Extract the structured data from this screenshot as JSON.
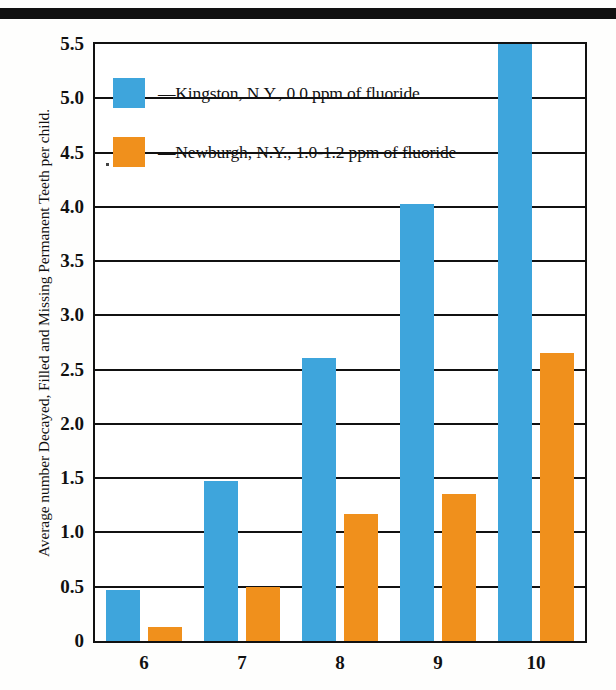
{
  "chart_data": {
    "type": "bar",
    "title": "",
    "subtitle": "",
    "xlabel": "",
    "ylabel": "Average number Decayed, Filled and Missing Permanent Teeth per child.",
    "categories": [
      "6",
      "7",
      "8",
      "9",
      "10"
    ],
    "series": [
      {
        "name": "—Kingston, N.Y., 0.0 ppm of fluoride",
        "short_name": "Kingston, N.Y.",
        "color": "#3EA5DC",
        "values": [
          0.47,
          1.47,
          2.61,
          4.03,
          5.5
        ]
      },
      {
        "name": "—Newburgh, N.Y., 1.0-1.2 ppm of fluoride",
        "short_name": "Newburgh, N.Y.",
        "color": "#F0901C",
        "values": [
          0.13,
          0.5,
          1.17,
          1.35,
          2.65
        ]
      }
    ],
    "ylim": [
      0,
      5.5
    ],
    "yticks": [
      "0",
      "0.5",
      "1.0",
      "1.5",
      "2.0",
      "2.5",
      "3.0",
      "3.5",
      "4.0",
      "4.5",
      "5.0",
      "5.5"
    ],
    "ytick_values": [
      0,
      0.5,
      1.0,
      1.5,
      2.0,
      2.5,
      3.0,
      3.5,
      4.0,
      4.5,
      5.0,
      5.5
    ],
    "grid": true,
    "grid_axis": "y",
    "legend_position": "top-left"
  },
  "legend": {
    "entries": [
      {
        "label": "—Kingston, N.Y., 0.0 ppm of fluoride",
        "color": "#3EA5DC"
      },
      {
        "label": "—Newburgh, N.Y., 1.0-1.2 ppm of fluoride",
        "color": "#F0901C"
      }
    ]
  },
  "axis": {
    "y_title": "Average number Decayed, Filled and Missing Permanent Teeth per child."
  },
  "colors": {
    "kingston_blue": "#3EA5DC",
    "newburgh_orange": "#F0901C",
    "frame": "#111111",
    "background": "#ffffff",
    "top_rule": "#111111"
  }
}
